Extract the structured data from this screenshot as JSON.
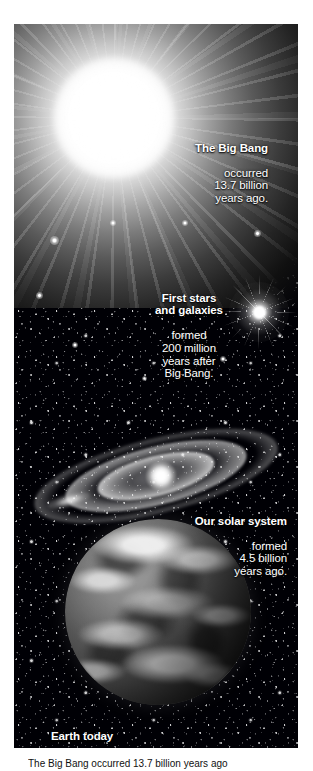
{
  "figure": {
    "name": "cosmic-timeline-infographic",
    "panel_background": "#000005",
    "page_background": "#ffffff",
    "text_color": "#ffffff"
  },
  "captions": [
    {
      "id": "big-bang",
      "heading": "The Big Bang",
      "body": "occurred\n13.7 billion\nyears ago.",
      "align": "right",
      "value": "13.7 billion years"
    },
    {
      "id": "first-stars",
      "heading": "First stars\nand galaxies",
      "body": "formed\n200 million\nyears after\nBig Bang.",
      "align": "center",
      "value": "200 million years"
    },
    {
      "id": "solar-system",
      "heading": "Our solar system",
      "body": "formed\n4.5 billion\nyears ago.",
      "align": "right",
      "value": "4.5 billion years"
    },
    {
      "id": "earth-today",
      "heading": "Earth today",
      "body": "",
      "align": "left",
      "value": "present day"
    }
  ],
  "credit": {
    "text": "The Big Bang occurred 13.7 billion years ago"
  },
  "icons": {
    "burst": "big-bang-burst-icon",
    "star": "star-icon",
    "galaxy": "spiral-galaxy-icon",
    "planet": "earth-globe-icon"
  }
}
